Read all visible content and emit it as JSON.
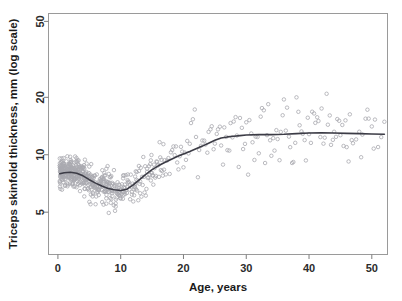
{
  "chart_data": {
    "type": "scatter",
    "title": "",
    "xlabel": "Age, years",
    "ylabel": "Triceps skinfold thickness, mm (log scale)",
    "yscale": "log",
    "xscale": "linear",
    "xlim": [
      -1.5,
      52.5
    ],
    "ylim": [
      3.0,
      55.0
    ],
    "xticks": [
      0,
      10,
      20,
      30,
      40,
      50
    ],
    "xticklabels": [
      "0",
      "10",
      "20",
      "30",
      "40",
      "50"
    ],
    "yticks": [
      5,
      10,
      20,
      50
    ],
    "yticklabels": [
      "5",
      "10",
      "20",
      "50"
    ],
    "grid": false,
    "legend": null,
    "point_color": "#a9a9b0",
    "point_marker": "open-circle",
    "curve_color": "#3c3c46",
    "frame_color": "#9a9a9a",
    "background": "#ffffff",
    "series": [
      {
        "name": "fitted-smooth-curve",
        "type": "line",
        "x": [
          0.3,
          1.0,
          2.0,
          3.0,
          4.0,
          5.0,
          6.0,
          7.0,
          8.0,
          9.0,
          10.0,
          11.0,
          12.0,
          13.0,
          14.0,
          15.0,
          16.0,
          17.0,
          18.0,
          19.0,
          20.0,
          21.0,
          22.0,
          23.0,
          24.0,
          25.0,
          26.0,
          27.0,
          28.0,
          29.0,
          30.0,
          32.0,
          34.0,
          36.0,
          38.0,
          40.0,
          42.0,
          44.0,
          46.0,
          48.0,
          50.0,
          52.0
        ],
        "y": [
          7.95,
          8.05,
          8.1,
          8.0,
          7.75,
          7.4,
          7.1,
          6.85,
          6.65,
          6.55,
          6.5,
          6.6,
          6.95,
          7.4,
          7.9,
          8.35,
          8.75,
          9.1,
          9.45,
          9.8,
          10.1,
          10.4,
          10.75,
          11.1,
          11.5,
          11.9,
          12.25,
          12.4,
          12.5,
          12.6,
          12.7,
          12.75,
          12.75,
          12.8,
          12.9,
          13.0,
          13.05,
          13.0,
          12.95,
          12.9,
          12.85,
          12.8
        ]
      },
      {
        "name": "observations",
        "type": "scatter",
        "n_points": 620,
        "x": [
          0.4,
          0.5,
          0.6,
          0.6,
          0.7,
          0.8,
          0.8,
          0.9,
          0.9,
          1.0,
          1.0,
          1.1,
          1.1,
          1.2,
          1.2,
          1.3,
          1.3,
          1.4,
          1.4,
          1.5,
          1.5,
          1.6,
          1.6,
          1.7,
          1.7,
          1.8,
          1.8,
          1.9,
          1.9,
          2.0,
          2.0,
          2.1,
          2.1,
          2.2,
          2.2,
          2.3,
          2.3,
          2.4,
          2.4,
          2.5,
          2.5,
          2.6,
          2.6,
          2.7,
          2.7,
          2.8,
          2.8,
          2.9,
          2.9,
          3.0,
          3.0,
          3.1,
          3.1,
          3.2,
          3.2,
          3.3,
          3.3,
          3.4,
          3.4,
          3.5,
          3.5,
          3.6,
          3.6,
          3.7,
          3.7,
          3.8,
          3.8,
          3.9,
          3.9,
          4.0,
          4.0,
          4.1,
          4.2,
          4.2,
          4.3,
          4.3,
          4.4,
          4.5,
          4.5,
          4.6,
          4.6,
          4.7,
          4.8,
          4.8,
          4.9,
          5.0,
          5.0,
          5.1,
          5.2,
          5.3,
          5.3,
          5.4,
          5.5,
          5.6,
          5.6,
          5.7,
          5.8,
          5.9,
          6.0,
          6.0,
          6.1,
          6.2,
          6.3,
          6.4,
          6.5,
          6.5,
          6.6,
          6.7,
          6.8,
          6.9,
          7.0,
          7.0,
          7.1,
          7.2,
          7.3,
          7.4,
          7.5,
          7.5,
          7.6,
          7.7,
          7.8,
          7.9,
          8.0,
          8.0,
          8.1,
          8.2,
          8.3,
          8.4,
          8.5,
          8.5,
          8.6,
          8.7,
          8.8,
          8.9,
          9.0,
          9.0,
          9.1,
          9.2,
          9.3,
          9.4,
          9.5,
          9.5,
          9.6,
          9.7,
          9.8,
          9.9,
          10.0,
          10.0,
          10.1,
          10.2,
          10.3,
          10.4,
          10.5,
          10.6,
          10.7,
          10.8,
          10.9,
          11.0,
          11.1,
          11.2,
          11.3,
          11.4,
          11.5,
          11.6,
          11.7,
          11.8,
          11.9,
          12.0,
          12.1,
          12.2,
          12.3,
          12.4,
          12.5,
          12.6,
          12.7,
          12.8,
          12.9,
          13.0,
          13.1,
          13.2,
          13.3,
          13.4,
          13.5,
          13.6,
          13.7,
          13.8,
          13.9,
          14.0,
          14.1,
          14.2,
          14.3,
          14.4,
          14.5,
          14.6,
          14.7,
          14.8,
          14.9,
          15.0,
          15.1,
          15.2,
          15.3,
          15.4,
          15.5,
          15.6,
          15.7,
          15.8,
          15.9,
          16.0,
          16.1,
          16.2,
          16.3,
          16.4,
          16.5,
          16.6,
          16.7,
          16.8,
          16.9,
          17.0,
          17.2,
          17.4,
          17.6,
          17.8,
          18.0,
          18.2,
          18.4,
          18.6,
          18.8,
          19.0,
          19.2,
          19.4,
          19.6,
          19.8,
          20.0,
          20.2,
          20.4,
          20.6,
          20.8,
          21.0,
          21.2,
          21.5,
          21.8,
          22.0,
          22.3,
          22.5,
          22.8,
          23.0,
          23.3,
          23.5,
          23.8,
          24.0,
          24.3,
          24.5,
          24.8,
          25.0,
          25.3,
          25.5,
          25.8,
          26.0,
          26.3,
          26.5,
          26.8,
          27.0,
          27.3,
          27.5,
          27.8,
          28.0,
          28.3,
          28.5,
          28.8,
          29.0,
          29.3,
          29.5,
          29.8,
          30.0,
          30.3,
          30.5,
          30.8,
          31.0,
          31.3,
          31.5,
          31.8,
          32.0,
          32.3,
          32.5,
          32.8,
          33.0,
          33.3,
          33.5,
          33.8,
          34.0,
          34.3,
          34.5,
          34.8,
          35.0,
          35.3,
          35.5,
          35.8,
          36.0,
          36.3,
          36.5,
          36.8,
          37.0,
          37.3,
          37.5,
          37.8,
          38.0,
          38.3,
          38.5,
          38.8,
          39.0,
          39.3,
          39.5,
          39.8,
          40.0,
          40.3,
          40.5,
          40.8,
          41.0,
          41.3,
          41.5,
          41.8,
          42.0,
          42.3,
          42.5,
          42.8,
          43.0,
          43.3,
          43.5,
          43.8,
          44.0,
          44.3,
          44.5,
          44.8,
          45.0,
          45.3,
          45.5,
          45.8,
          46.0,
          46.3,
          46.5,
          46.8,
          47.0,
          47.5,
          48.0,
          48.3,
          48.5,
          49.0,
          49.3,
          49.5,
          50.0,
          50.3,
          50.5,
          51.0,
          51.5,
          52.0
        ],
        "y_range_note": "Values span roughly 3.2 to 37 mm; dense cluster 5-12 mm for ages 0-16, widening to 5-30 mm for ages 20-52."
      }
    ],
    "annotations": []
  }
}
